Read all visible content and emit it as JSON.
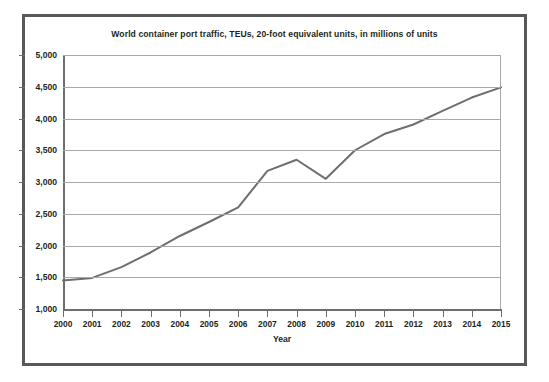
{
  "chart_data": {
    "type": "line",
    "title": "World container port traffic, TEUs, 20-foot equivalent units, in millions of units",
    "xlabel": "Year",
    "ylabel": "",
    "categories": [
      "2000",
      "2001",
      "2002",
      "2003",
      "2004",
      "2005",
      "2006",
      "2007",
      "2008",
      "2009",
      "2010",
      "2011",
      "2012",
      "2013",
      "2014",
      "2015"
    ],
    "x": [
      2000,
      2001,
      2002,
      2003,
      2004,
      2005,
      2006,
      2007,
      2008,
      2009,
      2010,
      2011,
      2012,
      2013,
      2014,
      2015
    ],
    "values": [
      1450,
      1490,
      1660,
      1890,
      2150,
      2370,
      2600,
      3175,
      3350,
      3050,
      3500,
      3755,
      3905,
      4120,
      4330,
      4490
    ],
    "series": [
      {
        "name": "World container port traffic",
        "values": [
          1450,
          1490,
          1660,
          1890,
          2150,
          2370,
          2600,
          3175,
          3350,
          3050,
          3500,
          3755,
          3905,
          4120,
          4330,
          4490
        ]
      }
    ],
    "ylim": [
      1000,
      5000
    ],
    "xlim": [
      2000,
      2015
    ],
    "yticks": [
      1000,
      1500,
      2000,
      2500,
      3000,
      3500,
      4000,
      4500,
      5000
    ],
    "ytick_labels": [
      "1,000",
      "1,500",
      "2,000",
      "2,500",
      "3,000",
      "3,500",
      "4,000",
      "4,500",
      "5,000"
    ],
    "grid": true,
    "legend": false,
    "legend_position": "none",
    "line_color": "#6d6e71",
    "grid_color": "#a7a9ac",
    "axis_color": "#6d6e71",
    "text_color": "#231f20",
    "border_color": "#58585a",
    "background_color": "#ffffff"
  }
}
